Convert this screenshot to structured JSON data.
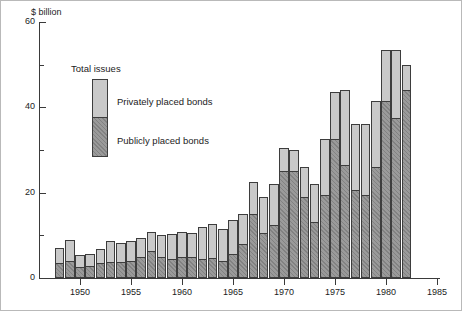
{
  "chart_data": {
    "type": "bar",
    "subtype": "stacked-bar",
    "title": "",
    "xlabel": "",
    "ylabel": "$ billion",
    "ylim": [
      0,
      60
    ],
    "xlim": [
      1947,
      1985
    ],
    "grid": false,
    "y_major_ticks": [
      0,
      20,
      40,
      60
    ],
    "y_minor_ticks": [
      10,
      30,
      50
    ],
    "y_tick_labels": [
      "0",
      "20",
      "40",
      "60"
    ],
    "x_ticks": [
      1950,
      1955,
      1960,
      1965,
      1970,
      1975,
      1980,
      1985
    ],
    "x_tick_labels": [
      "1950",
      "1955",
      "1960",
      "1965",
      "1970",
      "1975",
      "1980",
      "1985"
    ],
    "legend": {
      "title": "Total issues",
      "position": "inside-upper-left",
      "entries": [
        {
          "name": "Privately placed bonds",
          "color": "#c9c9c9"
        },
        {
          "name": "Publicly placed bonds",
          "color": "#9a9a9a"
        }
      ]
    },
    "categories": [
      1948,
      1949,
      1950,
      1951,
      1952,
      1953,
      1954,
      1955,
      1956,
      1957,
      1958,
      1959,
      1960,
      1961,
      1962,
      1963,
      1964,
      1965,
      1966,
      1967,
      1968,
      1969,
      1970,
      1971,
      1972,
      1973,
      1974,
      1975,
      1976,
      1977,
      1978,
      1979,
      1980,
      1981,
      1982
    ],
    "series": [
      {
        "name": "Publicly placed bonds",
        "color": "#9a9a9a",
        "values": [
          3.5,
          4.0,
          2.5,
          2.7,
          3.6,
          3.8,
          3.8,
          4.1,
          5.0,
          6.3,
          5.0,
          4.5,
          4.8,
          5.0,
          4.5,
          4.7,
          4.0,
          5.5,
          8.0,
          15.0,
          10.5,
          12.5,
          25.0,
          25.0,
          19.0,
          13.0,
          19.5,
          32.5,
          26.5,
          20.5,
          19.5,
          26.0,
          41.5,
          37.5,
          44.0
        ]
      },
      {
        "name": "Privately placed bonds",
        "color": "#c9c9c9",
        "values": [
          3.5,
          5.0,
          2.8,
          3.0,
          3.3,
          5.0,
          4.5,
          4.7,
          4.5,
          4.5,
          5.2,
          5.8,
          6.0,
          5.5,
          7.5,
          8.0,
          7.5,
          8.0,
          7.0,
          7.5,
          8.5,
          9.5,
          5.5,
          5.0,
          7.0,
          9.0,
          13.0,
          11.0,
          17.5,
          15.5,
          16.5,
          15.5,
          12.0,
          16.0,
          6.0
        ]
      }
    ],
    "totals": [
      7.0,
      9.0,
      5.3,
      5.7,
      6.9,
      8.8,
      8.3,
      8.8,
      9.5,
      10.8,
      10.2,
      10.3,
      10.8,
      10.5,
      12.0,
      12.7,
      11.5,
      13.5,
      15.0,
      22.5,
      19.0,
      22.0,
      30.5,
      30.0,
      26.0,
      22.0,
      32.5,
      43.5,
      44.0,
      36.0,
      36.0,
      41.5,
      53.5,
      53.5,
      50.0
    ]
  }
}
